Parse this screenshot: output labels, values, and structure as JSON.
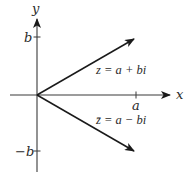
{
  "diagram": {
    "type": "complex-plane",
    "axes": {
      "x_label": "x",
      "y_label": "y",
      "x_tick_label": "a",
      "y_tick_pos_label": "b",
      "y_tick_neg_label": "−b"
    },
    "vectors": [
      {
        "name": "z",
        "label": "z = a + bi",
        "direction": "up-right"
      },
      {
        "name": "z-conjugate",
        "label": "z̄ = a − bi",
        "direction": "down-right"
      }
    ],
    "colors": {
      "line": "#2a2a2a",
      "axis": "#3a3a3a",
      "background": "#ffffff"
    }
  }
}
